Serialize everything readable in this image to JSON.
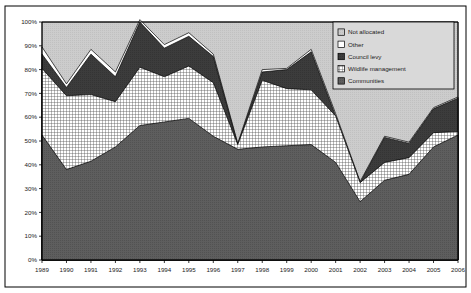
{
  "chart_data": {
    "type": "area",
    "stacked": true,
    "stack_mode": "percent",
    "title": "",
    "subtitle": "",
    "xlabel": "",
    "ylabel": "",
    "grid": false,
    "legend_position": "top-right",
    "ylim": [
      0,
      100
    ],
    "ytick_labels": [
      "0%",
      "10%",
      "20%",
      "30%",
      "40%",
      "50%",
      "60%",
      "70%",
      "80%",
      "90%",
      "100%"
    ],
    "ytick_values": [
      0,
      10,
      20,
      30,
      40,
      50,
      60,
      70,
      80,
      90,
      100
    ],
    "categories": [
      "1989",
      "1990",
      "1991",
      "1992",
      "1993",
      "1994",
      "1995",
      "1996",
      "1997",
      "1998",
      "1999",
      "2000",
      "2001",
      "2002",
      "2003",
      "2004",
      "2005",
      "2006"
    ],
    "x": [
      1989,
      1990,
      1991,
      1992,
      1993,
      1994,
      1995,
      1996,
      1997,
      1998,
      1999,
      2000,
      2001,
      2002,
      2003,
      2004,
      2005,
      2006
    ],
    "series": [
      {
        "name": "Communities",
        "pattern": "solid-dark-gray",
        "color": "#5a5a5a",
        "values": [
          52.5,
          38.0,
          41.5,
          47.5,
          56.5,
          58.0,
          59.5,
          52.0,
          46.5,
          47.5,
          48.0,
          48.5,
          41.0,
          24.5,
          33.5,
          36.0,
          47.5,
          52.5
        ]
      },
      {
        "name": "Wildlife management",
        "pattern": "crosshatch",
        "color": "#f2f2f2",
        "values": [
          28.0,
          31.0,
          28.0,
          19.0,
          24.5,
          19.0,
          22.0,
          22.5,
          2.0,
          28.0,
          24.0,
          23.0,
          19.5,
          8.0,
          7.5,
          7.0,
          6.0,
          1.5
        ]
      },
      {
        "name": "Council levy",
        "pattern": "solid-dark",
        "color": "#3a3a3a",
        "values": [
          6.0,
          3.5,
          17.0,
          10.5,
          19.0,
          12.0,
          12.5,
          11.0,
          0.0,
          3.5,
          8.0,
          16.0,
          0.0,
          0.0,
          10.5,
          6.0,
          10.0,
          14.0
        ]
      },
      {
        "name": "Other",
        "pattern": "white",
        "color": "#ffffff",
        "values": [
          3.0,
          1.5,
          2.0,
          2.0,
          1.0,
          1.5,
          1.5,
          1.0,
          0.5,
          1.0,
          0.5,
          1.0,
          1.0,
          0.5,
          0.5,
          0.5,
          0.5,
          0.5
        ]
      },
      {
        "name": "Not allocated",
        "pattern": "light-gray",
        "color": "#c9c9c9",
        "values": [
          10.5,
          26.0,
          11.5,
          21.0,
          0.0,
          9.5,
          4.5,
          13.5,
          51.0,
          20.0,
          19.5,
          11.5,
          38.5,
          67.0,
          48.0,
          50.5,
          36.0,
          31.5
        ]
      }
    ],
    "cumulative_tops": {
      "communities": [
        52.5,
        38.0,
        41.5,
        47.5,
        56.5,
        58.0,
        59.5,
        52.0,
        46.5,
        47.5,
        48.0,
        48.5,
        41.0,
        24.5,
        33.5,
        36.0,
        47.5,
        52.5
      ],
      "wildlife": [
        80.5,
        69.0,
        69.5,
        66.5,
        81.0,
        77.0,
        81.5,
        74.5,
        48.5,
        75.5,
        72.0,
        71.5,
        60.5,
        32.5,
        41.0,
        43.0,
        53.5,
        54.0
      ],
      "council_levy": [
        86.5,
        72.5,
        86.5,
        77.0,
        100.0,
        89.0,
        94.0,
        85.5,
        48.5,
        79.0,
        80.0,
        87.5,
        60.5,
        32.5,
        51.5,
        49.0,
        63.5,
        68.0
      ],
      "other": [
        89.5,
        74.0,
        88.5,
        79.0,
        100.0,
        90.5,
        95.5,
        86.5,
        49.0,
        80.0,
        80.5,
        88.5,
        61.5,
        33.0,
        52.0,
        49.5,
        64.0,
        68.5
      ],
      "not_allocated": [
        100,
        100,
        100,
        100,
        100,
        100,
        100,
        100,
        100,
        100,
        100,
        100,
        100,
        100,
        100,
        100,
        100,
        100
      ]
    }
  },
  "legend": {
    "items": [
      {
        "label": "Not allocated",
        "swatch": "light-gray"
      },
      {
        "label": "Other",
        "swatch": "white"
      },
      {
        "label": "Council levy",
        "swatch": "solid-dark"
      },
      {
        "label": "Wildlife management",
        "swatch": "crosshatch"
      },
      {
        "label": "Communities",
        "swatch": "solid-dark-gray"
      }
    ]
  },
  "axes": {
    "y_ticks": [
      "100%",
      "90%",
      "80%",
      "70%",
      "60%",
      "50%",
      "40%",
      "30%",
      "20%",
      "10%",
      "0%"
    ],
    "x_ticks": [
      "1989",
      "1990",
      "1991",
      "1992",
      "1993",
      "1994",
      "1995",
      "1996",
      "1997",
      "1998",
      "1999",
      "2000",
      "2001",
      "2002",
      "2003",
      "2004",
      "2005",
      "2006"
    ]
  },
  "colors": {
    "not_allocated": "#c9c9c9",
    "other": "#ffffff",
    "council_levy": "#3a3a3a",
    "wildlife_management": "#f2f2f2",
    "communities": "#5a5a5a",
    "axis": "#000000",
    "border": "#000000"
  }
}
